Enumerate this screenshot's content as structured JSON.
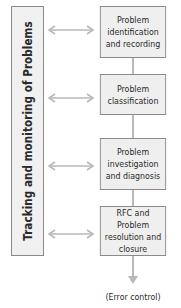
{
  "diagram": {
    "side_bar_label": "Tracking and monitoring of Problems",
    "steps": [
      {
        "label": "Problem identification and recording"
      },
      {
        "label": "Problem classification"
      },
      {
        "label": "Problem investigation and diagnosis"
      },
      {
        "label": "RFC and Problem resolution and closure"
      }
    ],
    "output_label": "(Error control)",
    "colors": {
      "box_fill": "#efefef",
      "box_border": "#8a8a8a",
      "arrow": "#b8b8b8",
      "text": "#2a2a2a"
    }
  }
}
